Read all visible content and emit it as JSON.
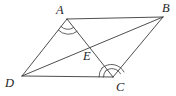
{
  "figure": {
    "name": "parallelogram-with-diagonals",
    "background_color": "#ffffff",
    "line_color": "#3a3a3a",
    "label_color": "#1e1e1e",
    "canvas": {
      "width": 176,
      "height": 96
    },
    "vertices": [
      {
        "id": "A",
        "label": "A",
        "x": 67,
        "y": 19,
        "label_x": 56,
        "label_y": 14
      },
      {
        "id": "B",
        "label": "B",
        "x": 163,
        "y": 17,
        "label_x": 162,
        "label_y": 12
      },
      {
        "id": "C",
        "label": "C",
        "x": 113,
        "y": 77,
        "label_x": 116,
        "label_y": 91
      },
      {
        "id": "D",
        "label": "D",
        "x": 22,
        "y": 76,
        "label_x": 5,
        "label_y": 87
      },
      {
        "id": "E",
        "label": "E",
        "x": 90,
        "y": 43,
        "label_x": 83,
        "label_y": 60
      }
    ],
    "segments": [
      {
        "name": "side-AB",
        "from": "A",
        "to": "B"
      },
      {
        "name": "side-BC",
        "from": "B",
        "to": "C"
      },
      {
        "name": "side-CD",
        "from": "C",
        "to": "D"
      },
      {
        "name": "side-DA",
        "from": "D",
        "to": "A"
      },
      {
        "name": "diagonal-AC",
        "from": "A",
        "to": "C"
      },
      {
        "name": "diagonal-DB",
        "from": "D",
        "to": "B"
      }
    ],
    "angle_marks": [
      {
        "name": "angle-mark-A",
        "at": "A",
        "arcs": 2,
        "description": "double arc at vertex A between AD and AC"
      },
      {
        "name": "angle-mark-C",
        "at": "C",
        "arcs": 2,
        "description": "double arc at vertex C between CD and CA"
      }
    ],
    "intersection": {
      "name": "diagonal-intersection",
      "label": "E",
      "description": "diagonals AC and DB meet at E"
    }
  }
}
